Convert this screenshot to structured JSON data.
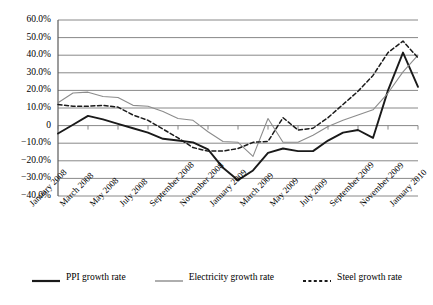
{
  "chart_data": {
    "type": "line",
    "title": "",
    "subtitle": "",
    "xlabel": "",
    "ylabel": "",
    "ylim": [
      -40,
      60
    ],
    "ytick_values": [
      60,
      50,
      40,
      30,
      20,
      10,
      0,
      -10,
      -20,
      -30,
      -40
    ],
    "ytick_labels": [
      "60.0%",
      "50.0%",
      "40.0%",
      "30.0%",
      "20.0%",
      "10.0%",
      "0",
      "−10.0%",
      "−20.0%",
      "−30.0%",
      "−40.0%"
    ],
    "grid": true,
    "grid_axis": "y",
    "legend_position": "bottom",
    "x": [
      "January 2008",
      "February 2008",
      "March 2008",
      "April 2008",
      "May 2008",
      "June 2008",
      "July 2008",
      "August 2008",
      "September 2008",
      "October 2008",
      "November 2008",
      "December 2008",
      "January 2009",
      "February 2009",
      "March 2009",
      "April 2009",
      "May 2009",
      "June 2009",
      "July 2009",
      "August 2009",
      "September 2009",
      "October 2009",
      "November 2009",
      "December 2009",
      "January 2010"
    ],
    "xtick_labels": [
      "January 2008",
      "March 2008",
      "May 2008",
      "July 2008",
      "September 2008",
      "November 2008",
      "January 2009",
      "March 2009",
      "May 2009",
      "July 2009",
      "September 2009",
      "November 2009",
      "January 2010"
    ],
    "xtick_indices": [
      0,
      2,
      4,
      6,
      8,
      10,
      12,
      14,
      16,
      18,
      20,
      22,
      24
    ],
    "series": [
      {
        "name": "PPI growth rate",
        "color": "#1a1a1a",
        "style": "solid",
        "width": 1.9,
        "values": [
          -4.5,
          0.5,
          5.5,
          3.5,
          1.0,
          -1.5,
          -4.0,
          -7.5,
          -8.5,
          -9.5,
          -13.5,
          -24.0,
          -31.0,
          -25.5,
          -15.5,
          -13.0,
          -14.5,
          -14.5,
          -8.5,
          -4.0,
          -2.5,
          -7.0,
          20.0,
          41.5,
          22.0
        ]
      },
      {
        "name": "Electricity growth rate",
        "color": "#8c8c8c",
        "style": "solid",
        "width": 1.1,
        "values": [
          13.0,
          18.5,
          19.0,
          16.5,
          16.0,
          11.5,
          11.0,
          8.0,
          4.0,
          3.0,
          -3.5,
          -9.0,
          -9.5,
          -17.5,
          4.0,
          -9.5,
          -9.5,
          -5.5,
          -0.5,
          3.0,
          6.0,
          9.0,
          18.5,
          30.5,
          40.0
        ]
      },
      {
        "name": "Steel growth rate",
        "color": "#1a1a1a",
        "style": "dashed",
        "width": 1.5,
        "values": [
          12.0,
          11.0,
          11.0,
          11.5,
          10.5,
          6.0,
          3.0,
          -2.0,
          -7.0,
          -12.5,
          -14.5,
          -14.5,
          -13.0,
          -9.5,
          -9.0,
          4.5,
          -2.5,
          -1.5,
          4.5,
          12.0,
          19.5,
          28.5,
          41.5,
          48.0,
          38.5
        ]
      }
    ]
  },
  "legend": {
    "entries": [
      {
        "label": "PPI growth rate"
      },
      {
        "label": "Electricity growth rate"
      },
      {
        "label": "Steel growth rate"
      }
    ]
  }
}
